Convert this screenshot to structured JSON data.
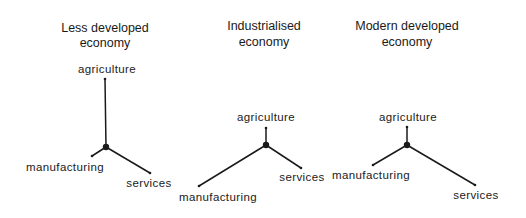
{
  "diagrams": [
    {
      "title_line1": "Less developed",
      "title_line2": "economy",
      "labels": {
        "agriculture": "agriculture",
        "manufacturing": "manufacturing",
        "services": "services"
      },
      "relative_lengths": {
        "agriculture": "long",
        "manufacturing": "short",
        "services": "medium"
      }
    },
    {
      "title_line1": "Industrialised",
      "title_line2": "economy",
      "labels": {
        "agriculture": "agriculture",
        "manufacturing": "manufacturing",
        "services": "services"
      },
      "relative_lengths": {
        "agriculture": "short",
        "manufacturing": "long",
        "services": "medium"
      }
    },
    {
      "title_line1": "Modern developed",
      "title_line2": "economy",
      "labels": {
        "agriculture": "agriculture",
        "manufacturing": "manufacturing",
        "services": "services"
      },
      "relative_lengths": {
        "agriculture": "short",
        "manufacturing": "medium",
        "services": "long"
      }
    }
  ],
  "colors": {
    "ink": "#1a1a1a",
    "background": "#ffffff"
  }
}
